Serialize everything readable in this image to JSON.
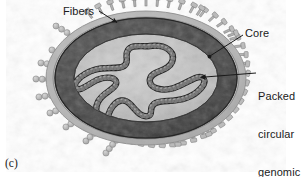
{
  "figure": {
    "panel_letter": "(c)",
    "labels": {
      "fibers": "Fibers",
      "core": "Core",
      "packed_dna": "Packed\ncircular\ngenomic\nDNA"
    },
    "label_lines": {
      "packed_dna_line1": "Packed",
      "packed_dna_line2": "circular",
      "packed_dna_line3": "genomic",
      "packed_dna_line4": "DNA"
    },
    "colors": {
      "background": "#ffffff",
      "text": "#1a1a1a",
      "leader_line": "#1a1a1a",
      "envelope_outer": "#b9b9b9",
      "envelope_mid": "#a8a8a8",
      "capsid_dark": "#4a4a4a",
      "capsid_darker": "#3a3a3a",
      "core_light": "#c9c9c9",
      "core_mottle": "#9b9b9b",
      "dna_bead": "#2c2c2c",
      "dna_bead_light": "#6e6e6e",
      "fiber_bead": "#bdbdbd",
      "fiber_bead_edge": "#8a8a8a",
      "spike": "#b3b3b3",
      "spike_edge": "#7d7d7d"
    },
    "structures": [
      {
        "name": "fibers",
        "count": 11,
        "description": "beaded filaments radiating from left and lower-left of the virion"
      },
      {
        "name": "spikes",
        "count": 40,
        "description": "club-shaped surface projections around the envelope perimeter"
      },
      {
        "name": "envelope",
        "description": "light gray outer membrane layer"
      },
      {
        "name": "core",
        "description": "dark gray capsid shell enclosing the nucleoid"
      },
      {
        "name": "packed-dna",
        "description": "dark beaded circular genome coiled inside the core"
      }
    ]
  }
}
